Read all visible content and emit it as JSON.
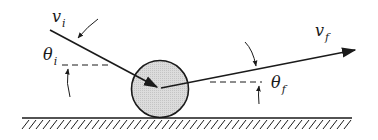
{
  "diagram": {
    "labels": {
      "v_initial": {
        "base": "v",
        "subscript": "i"
      },
      "theta_initial": {
        "base": "θ",
        "subscript": "i"
      },
      "v_final": {
        "base": "v",
        "subscript": "f"
      },
      "theta_final": {
        "base": "θ",
        "subscript": "f"
      }
    },
    "colors": {
      "line": "#1a1a1a",
      "ball_fill": "#d4d4d4",
      "background": "#ffffff"
    }
  }
}
